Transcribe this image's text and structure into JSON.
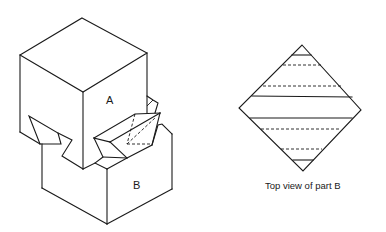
{
  "figure": {
    "type": "isometric dovetail joint diagram",
    "parts": [
      {
        "id": "A",
        "label": "A",
        "description": "Upper block (cube) with dovetail tongues"
      },
      {
        "id": "B",
        "label": "B",
        "description": "Lower block with dovetail sockets"
      }
    ],
    "top_view": {
      "caption": "Top view of part B",
      "shape": "diamond",
      "lines": [
        {
          "style": "solid",
          "y": 55
        },
        {
          "style": "dashed",
          "y": 65
        },
        {
          "style": "dashed",
          "y": 86
        },
        {
          "style": "solid",
          "y": 97
        },
        {
          "style": "solid",
          "y": 118
        },
        {
          "style": "dashed",
          "y": 129
        },
        {
          "style": "dashed",
          "y": 149
        },
        {
          "style": "solid",
          "y": 160
        }
      ]
    },
    "colors": {
      "line": "#1a1a1a",
      "background": "#ffffff"
    }
  }
}
